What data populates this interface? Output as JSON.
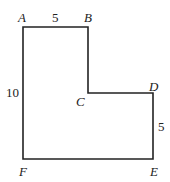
{
  "diagram": {
    "shape": "L-shaped polygon",
    "vertices": [
      "A",
      "B",
      "C",
      "D",
      "E",
      "F"
    ],
    "vertex_labels": {
      "A": "A",
      "B": "B",
      "C": "C",
      "D": "D",
      "E": "E",
      "F": "F"
    },
    "side_labels": {
      "AB": "5",
      "AF": "10",
      "DE": "5"
    },
    "line_color": "#222222"
  }
}
